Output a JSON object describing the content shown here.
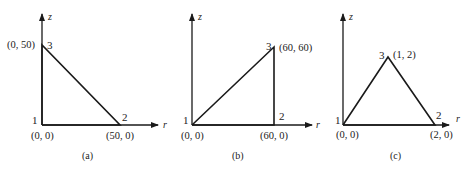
{
  "figure": {
    "panels": [
      {
        "caption": "(a)",
        "axes": {
          "x": "r",
          "y": "z"
        },
        "nodes": [
          {
            "id": "1",
            "coord_label": "(0, 0)"
          },
          {
            "id": "2",
            "coord_label": "(50, 0)"
          },
          {
            "id": "3",
            "coord_label": "(0, 50)"
          }
        ]
      },
      {
        "caption": "(b)",
        "axes": {
          "x": "r",
          "y": "z"
        },
        "nodes": [
          {
            "id": "1",
            "coord_label": "(0, 0)"
          },
          {
            "id": "2",
            "coord_label": "(60, 0)"
          },
          {
            "id": "3",
            "coord_label": "(60, 60)"
          }
        ]
      },
      {
        "caption": "(c)",
        "axes": {
          "x": "r",
          "y": "z"
        },
        "nodes": [
          {
            "id": "1",
            "coord_label": "(0, 0)"
          },
          {
            "id": "2",
            "coord_label": "(2, 0)"
          },
          {
            "id": "3",
            "coord_label": "(1, 2)"
          }
        ]
      }
    ]
  }
}
